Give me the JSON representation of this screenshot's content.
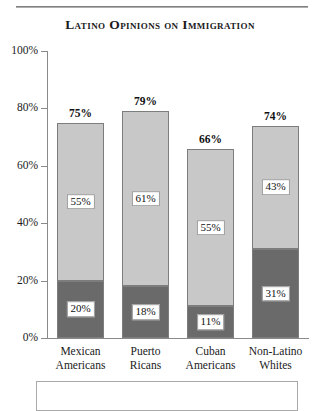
{
  "chart_data": {
    "type": "bar",
    "title": "Latino Opinions on Immigration",
    "xlabel": "",
    "ylabel": "",
    "ylim": [
      0,
      100
    ],
    "ytick_labels": [
      "0%",
      "20%",
      "40%",
      "60%",
      "80%",
      "100%"
    ],
    "ytick_values": [
      0,
      20,
      40,
      60,
      80,
      100
    ],
    "grid": false,
    "legend": "none",
    "stacked": true,
    "categories": [
      "Mexican Americans",
      "Puerto Ricans",
      "Cuban Americans",
      "Non-Latino Whites"
    ],
    "category_lines": [
      [
        "Mexican",
        "Americans"
      ],
      [
        "Puerto",
        "Ricans"
      ],
      [
        "Cuban",
        "Americans"
      ],
      [
        "Non-Latino",
        "Whites"
      ]
    ],
    "series": [
      {
        "name": "lower-segment",
        "color": "#6a6a6a",
        "values": [
          20,
          18,
          11,
          31
        ],
        "labels": [
          "20%",
          "18%",
          "11%",
          "31%"
        ]
      },
      {
        "name": "upper-segment",
        "color": "#c8c8c8",
        "values": [
          55,
          61,
          55,
          43
        ],
        "labels": [
          "55%",
          "61%",
          "55%",
          "43%"
        ]
      }
    ],
    "totals": [
      75,
      79,
      66,
      74
    ],
    "total_labels": [
      "75%",
      "79%",
      "66%",
      "74%"
    ]
  },
  "colors": {
    "dark_segment": "#6a6a6a",
    "light_segment": "#c8c8c8",
    "axis": "#8a8a8a",
    "text": "#111111"
  }
}
